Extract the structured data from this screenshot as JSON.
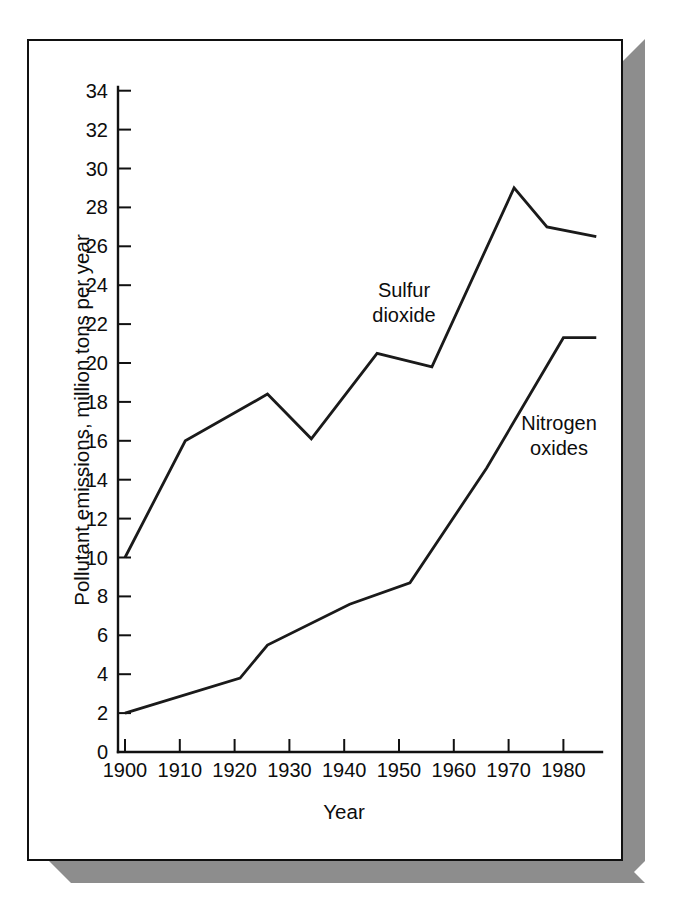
{
  "figure": {
    "frame": {
      "border_color": "#111111",
      "background_color": "#ffffff",
      "shadow_color": "#8d8d8d"
    }
  },
  "chart_data": {
    "type": "line",
    "title": "",
    "xlabel": "Year",
    "ylabel": "Pollutant emissions, million tons per year",
    "xlim": [
      1900,
      1986
    ],
    "ylim": [
      0,
      35
    ],
    "xticks": [
      1900,
      1910,
      1920,
      1930,
      1940,
      1950,
      1960,
      1970,
      1980
    ],
    "xtick_labels": [
      "1900",
      "1910",
      "1920",
      "1930",
      "1940",
      "1950",
      "1960",
      "1970",
      "1980"
    ],
    "yticks": [
      0,
      2,
      4,
      6,
      8,
      10,
      12,
      14,
      16,
      18,
      20,
      22,
      24,
      26,
      28,
      30,
      32,
      34
    ],
    "ytick_labels": [
      "0",
      "2",
      "4",
      "6",
      "8",
      "10",
      "12",
      "14",
      "16",
      "18",
      "20",
      "22",
      "24",
      "26",
      "28",
      "30",
      "32",
      "34"
    ],
    "grid": false,
    "legend_position": "inline-annotations",
    "line_color": "#1a1a1a",
    "series": [
      {
        "name": "Sulfur dioxide",
        "label_text": "Sulfur\ndioxide",
        "x": [
          1900,
          1911,
          1926,
          1934,
          1946,
          1956,
          1971,
          1977,
          1986
        ],
        "values": [
          10.0,
          16.0,
          18.4,
          16.1,
          20.5,
          19.8,
          29.0,
          27.0,
          26.5
        ]
      },
      {
        "name": "Nitrogen oxides",
        "label_text": "Nitrogen\noxides",
        "x": [
          1900,
          1921,
          1926,
          1941,
          1952,
          1966,
          1980,
          1986
        ],
        "values": [
          2.0,
          3.8,
          5.5,
          7.6,
          8.7,
          14.6,
          21.3,
          21.3
        ]
      }
    ]
  }
}
